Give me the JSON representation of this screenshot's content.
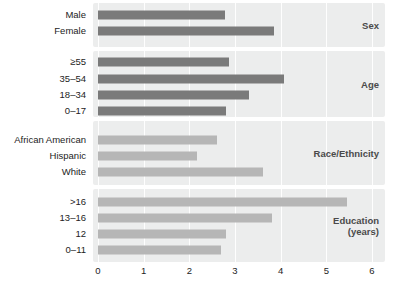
{
  "chart_data": {
    "type": "bar",
    "orientation": "horizontal",
    "title": "",
    "subtitle": "",
    "xlabel": "",
    "ylabel": "",
    "xlim": [
      0,
      6
    ],
    "xticks": [
      "0",
      "1",
      "2",
      "3",
      "4",
      "5",
      "6"
    ],
    "grid": true,
    "legend": "none",
    "colors": {
      "bar_dark": "#7a7a7a",
      "bar_light": "#b6b6b6",
      "panel_background": "#eceded",
      "gridline": "#ffffff",
      "text": "#232323",
      "panel_title_text": "#4a4a4a"
    },
    "groups": [
      {
        "name": "Sex",
        "title": "Sex",
        "shade": "dark",
        "categories": [
          "Male",
          "Female"
        ],
        "values": [
          2.78,
          3.86
        ]
      },
      {
        "name": "Age",
        "title": "Age",
        "shade": "dark",
        "categories": [
          "≥55",
          "35–54",
          "18–34",
          "0–17"
        ],
        "values": [
          2.87,
          4.08,
          3.31,
          2.8
        ]
      },
      {
        "name": "Race/Ethnicity",
        "title": "Race/Ethnicity",
        "shade": "light",
        "categories": [
          "African American",
          "Hispanic",
          "White"
        ],
        "values": [
          2.6,
          2.16,
          3.61
        ]
      },
      {
        "name": "Education (years)",
        "title": "Education\n(years)",
        "shade": "light-mixed",
        "categories": [
          ">16",
          "13–16",
          "12",
          "0–11"
        ],
        "values": [
          5.45,
          3.8,
          2.8,
          2.7
        ]
      }
    ]
  },
  "ylabels": [
    "Male",
    "Female",
    "≥55",
    "35–54",
    "18–34",
    "0–17",
    "African American",
    "Hispanic",
    "White",
    ">16",
    "13–16",
    "12",
    "0–11"
  ],
  "panel_titles": {
    "sex": "Sex",
    "age": "Age",
    "race": "Race/Ethnicity",
    "education": "Education\n(years)"
  },
  "xticks": [
    "0",
    "1",
    "2",
    "3",
    "4",
    "5",
    "6"
  ]
}
